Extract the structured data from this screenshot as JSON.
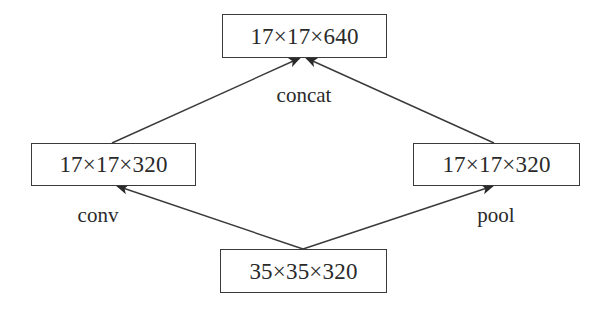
{
  "diagram": {
    "nodes": [
      {
        "id": "output",
        "text": "17×17×640",
        "role": "concatenated output"
      },
      {
        "id": "conv_out",
        "text": "17×17×320",
        "role": "conv branch output"
      },
      {
        "id": "pool_out",
        "text": "17×17×320",
        "role": "pool branch output"
      },
      {
        "id": "input",
        "text": "35×35×320",
        "role": "input"
      }
    ],
    "edges": [
      {
        "from": "input",
        "to": "conv_out",
        "label": "conv"
      },
      {
        "from": "input",
        "to": "pool_out",
        "label": "pool"
      },
      {
        "from": "conv_out",
        "to": "output",
        "label": "concat"
      },
      {
        "from": "pool_out",
        "to": "output",
        "label": "concat"
      }
    ],
    "labels": {
      "concat": "concat",
      "conv": "conv",
      "pool": "pool"
    },
    "colors": {
      "line": "#3a3a3a",
      "text": "#2a2a2a",
      "background": "#ffffff"
    }
  }
}
